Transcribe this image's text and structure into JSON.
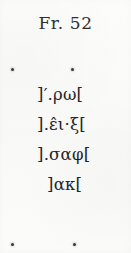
{
  "page": {
    "background_color": "#fbfbfa",
    "ink_color": "#242427"
  },
  "heading": {
    "label": "Fr. 52"
  },
  "registration_marks": {
    "top_left": "•",
    "top_right": "•",
    "bottom_left": "•",
    "bottom_right": "•"
  },
  "transcription": {
    "lines": [
      {
        "n": 1,
        "text": "]′.ρω[",
        "indent": "flush"
      },
      {
        "n": 2,
        "text": "].ε̂ι·ξ[",
        "indent": "flush"
      },
      {
        "n": 3,
        "text": "].σαφ[",
        "indent": "flush"
      },
      {
        "n": 4,
        "text": "]ακ[",
        "indent": "indent"
      }
    ]
  }
}
